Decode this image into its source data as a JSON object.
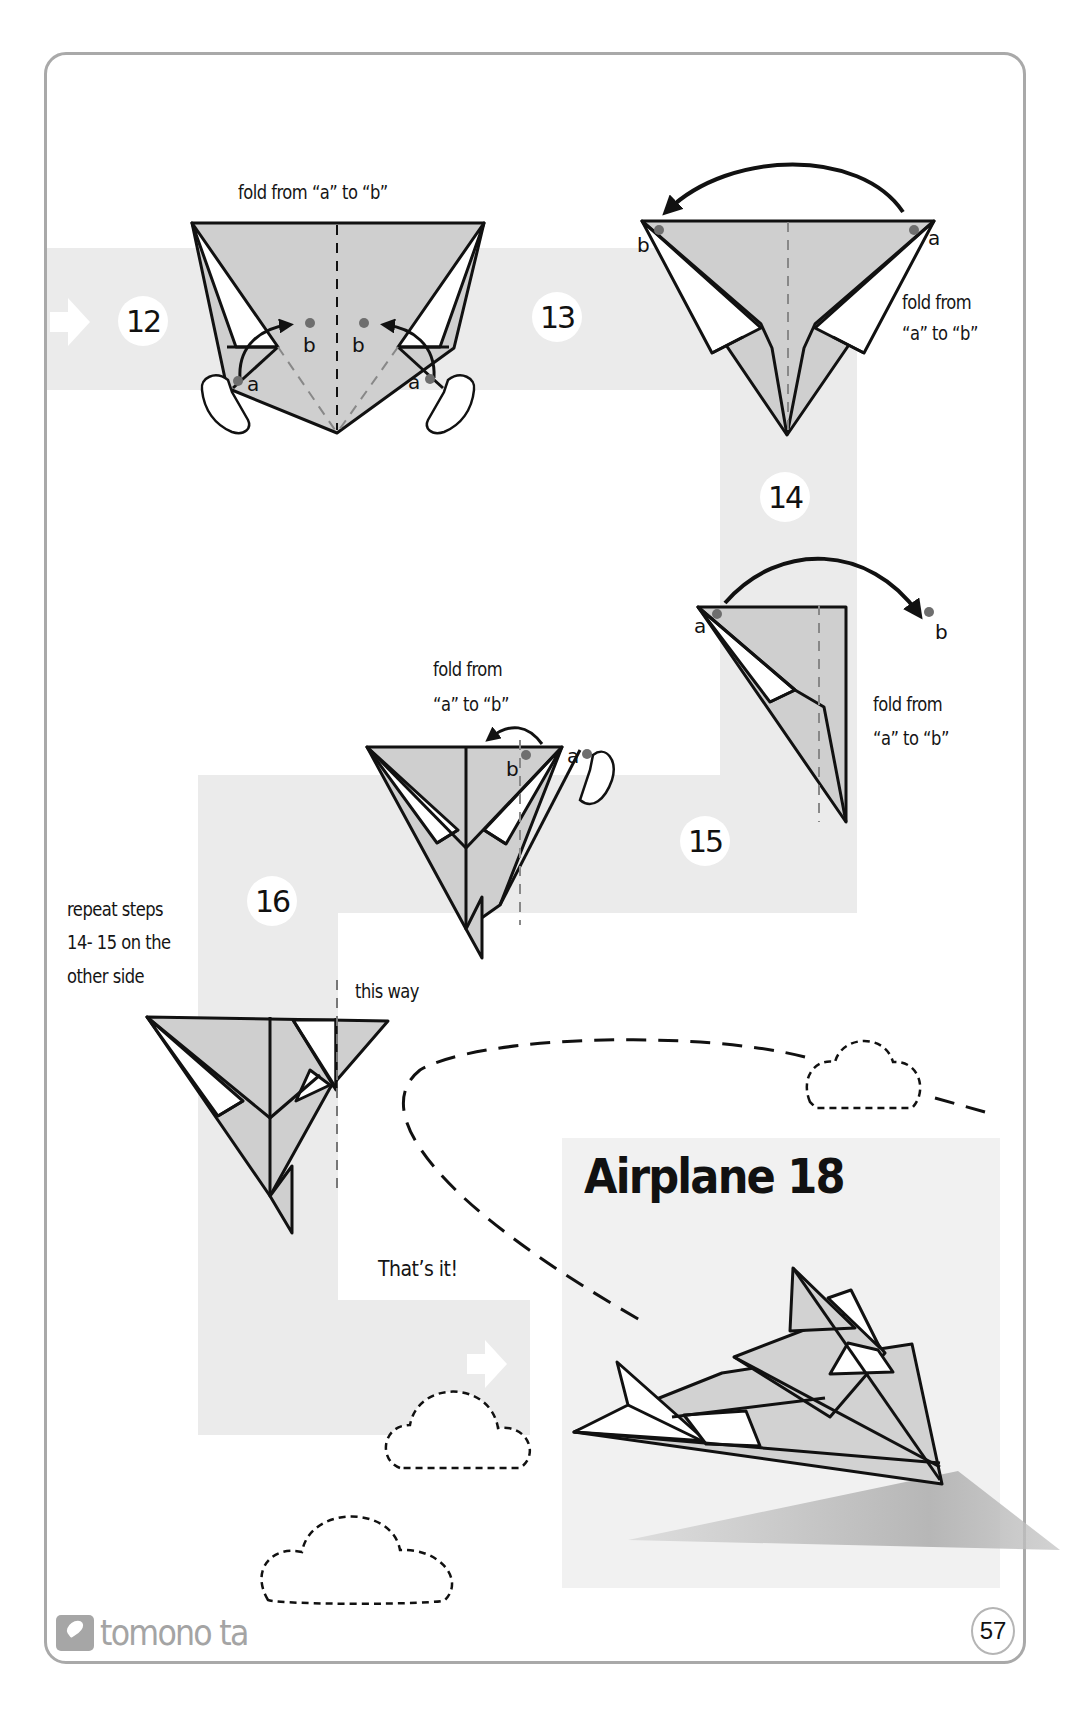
{
  "page": {
    "title": "Airplane 18",
    "page_number": "57",
    "brand": "tomono ta",
    "colors": {
      "paper_fill": "#cfcfcf",
      "path_band": "#ebebeb",
      "outline": "#111111",
      "marker_dot": "#6e6e6e",
      "frame_border": "#a9a9a9",
      "brand_gray": "#a4a4a4"
    }
  },
  "steps": [
    {
      "number": "12",
      "instruction": "fold from “a” to “b”",
      "markers": [
        "a",
        "b",
        "b",
        "a"
      ]
    },
    {
      "number": "13",
      "instruction_line1": "fold from",
      "instruction_line2": "“a” to “b”",
      "markers": [
        "b",
        "a"
      ]
    },
    {
      "number": "14",
      "instruction_line1": "fold from",
      "instruction_line2": "“a” to “b”",
      "markers": [
        "a",
        "b"
      ]
    },
    {
      "number": "15",
      "instruction_line1": "fold from",
      "instruction_line2": "“a” to “b”",
      "markers": [
        "b",
        "a"
      ]
    },
    {
      "number": "16",
      "instruction_line1": "repeat steps",
      "instruction_line2": "14- 15 on the",
      "instruction_line3": "other side",
      "direction_note": "this way"
    }
  ],
  "finish": {
    "message": "That’s it!",
    "model_name": "Airplane 18"
  },
  "icons": {
    "direction_arrow": "right-arrow-icon",
    "finger_hand": "pointing-hand-icon",
    "fold_arrow": "curved-arrow-icon",
    "cloud": "dashed-cloud-icon",
    "brand_logo": "brand-logo-icon"
  }
}
